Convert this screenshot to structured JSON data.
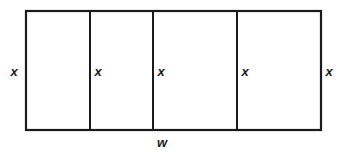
{
  "figure": {
    "background_color": "#ffffff",
    "stroke_color": "#1b1b1b"
  },
  "diagram": {
    "shape": "rectangle",
    "outer": {
      "x": 26,
      "y": 11,
      "width": 295,
      "height": 119,
      "stroke_width": 2.2
    },
    "dividers": [
      {
        "name": "divider-1",
        "x": 90,
        "stroke_width": 2.0
      },
      {
        "name": "divider-2",
        "x": 153,
        "stroke_width": 2.0
      },
      {
        "name": "divider-3",
        "x": 237,
        "stroke_width": 2.0
      }
    ],
    "vertical_labels": [
      {
        "name": "label-x-left-outside",
        "text": "x",
        "x": 14,
        "y": 76
      },
      {
        "name": "label-x-divider-1",
        "text": "x",
        "x": 98,
        "y": 76
      },
      {
        "name": "label-x-divider-2",
        "text": "x",
        "x": 161,
        "y": 76
      },
      {
        "name": "label-x-divider-3",
        "text": "x",
        "x": 245,
        "y": 76
      },
      {
        "name": "label-x-right-outside",
        "text": "x",
        "x": 329,
        "y": 76
      }
    ],
    "width_label": {
      "name": "label-w-bottom",
      "text": "w",
      "x": 162,
      "y": 147
    }
  }
}
